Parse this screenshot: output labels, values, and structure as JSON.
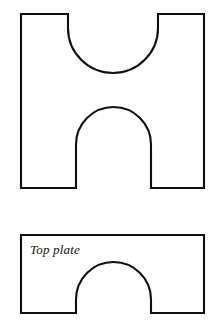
{
  "figure": {
    "background_color": "#ffffff",
    "line_color": "#12100e",
    "line_width": 2.1,
    "parts": [
      {
        "name": "upper-plate",
        "description": "H-shaped plate with semicircular notch cut into the top edge and an arched notch cut into the bottom edge",
        "label": "",
        "box": {
          "left": 21,
          "top": 14,
          "right": 204,
          "bottom": 188
        },
        "top_notch": {
          "left": 68,
          "right": 158,
          "bottom": 73,
          "straight_depth_to_y": 28,
          "radius": 45
        },
        "bottom_notch": {
          "left": 76,
          "right": 151,
          "apex": 107,
          "radius": 37.5
        },
        "path": "M 21 14 L 68 14 L 68 28 A 45 45 0 0 0 158 28 L 158 14 L 204 14 L 204 188 L 151 188 L 151 144.5 A 37.5 37.5 0 0 0 76 144.5 L 76 188 L 21 188 Z"
      },
      {
        "name": "lower-plate",
        "description": "Rectangular top plate with an arched notch cut into the bottom edge",
        "label": "Top plate",
        "label_position": {
          "x": 30,
          "y": 254
        },
        "box": {
          "left": 21,
          "top": 235,
          "right": 204,
          "bottom": 313
        },
        "bottom_notch": {
          "left": 76,
          "right": 151,
          "apex": 262,
          "radius": 37.5
        },
        "path": "M 21 235 L 204 235 L 204 313 L 151 313 L 151 299.5 A 37.5 37.5 0 0 0 76 299.5 L 76 313 L 21 313 Z"
      }
    ]
  }
}
